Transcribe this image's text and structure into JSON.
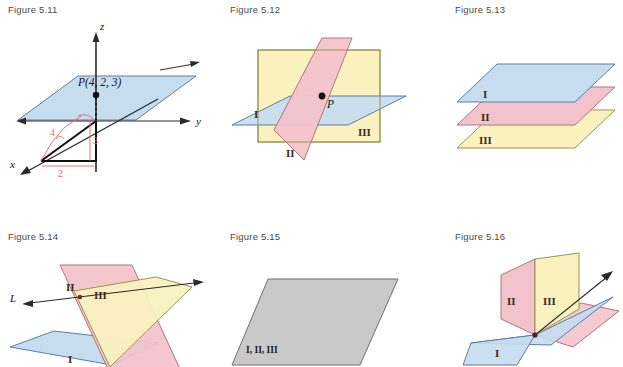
{
  "page": {
    "background": "#ffffff",
    "width": 623,
    "height": 342
  },
  "palette": {
    "blue_fill": "#c6dcef",
    "blue_stroke": "#5b7fa6",
    "pink_fill": "#f3c3cb",
    "pink_stroke": "#b4727f",
    "yellow_fill": "#f9f2bf",
    "yellow_stroke": "#9c9252",
    "grey_fill": "#c9c9c9",
    "grey_stroke": "#6e6e6e",
    "axis": "#2b2b2b",
    "red_annotation": "#e8676b",
    "label_text": "#4a4a4a"
  },
  "figures": [
    {
      "id": "fig-5-11",
      "label": "Figure 5.11",
      "type": "coordinate-axes-3d",
      "axes": [
        {
          "name": "z",
          "label": "z"
        },
        {
          "name": "y",
          "label": "y"
        },
        {
          "name": "x",
          "label": "x"
        }
      ],
      "point": {
        "label": "P(4, 2, 3)",
        "coords": [
          4,
          2,
          3
        ]
      },
      "measurements": [
        {
          "label": "4",
          "axis": "x-component"
        },
        {
          "label": "3",
          "axis": "z-component"
        },
        {
          "label": "2",
          "axis": "y-component"
        }
      ],
      "planes": [
        {
          "name": "horizontal-plane",
          "color": "blue"
        }
      ]
    },
    {
      "id": "fig-5-12",
      "label": "Figure 5.12",
      "type": "three-planes-single-point",
      "point": {
        "label": "P"
      },
      "planes": [
        {
          "name": "I",
          "label": "I",
          "color": "blue"
        },
        {
          "name": "II",
          "label": "II",
          "color": "pink"
        },
        {
          "name": "III",
          "label": "III",
          "color": "yellow"
        }
      ]
    },
    {
      "id": "fig-5-13",
      "label": "Figure 5.13",
      "type": "three-parallel-planes",
      "planes": [
        {
          "name": "I",
          "label": "I",
          "color": "blue"
        },
        {
          "name": "II",
          "label": "II",
          "color": "pink"
        },
        {
          "name": "III",
          "label": "III",
          "color": "yellow"
        }
      ]
    },
    {
      "id": "fig-5-14",
      "label": "Figure 5.14",
      "type": "three-planes-common-line",
      "line": {
        "label": "L"
      },
      "planes": [
        {
          "name": "I",
          "label": "I",
          "color": "blue"
        },
        {
          "name": "II",
          "label": "II",
          "color": "pink"
        },
        {
          "name": "III",
          "label": "III",
          "color": "yellow"
        }
      ]
    },
    {
      "id": "fig-5-15",
      "label": "Figure 5.15",
      "type": "coincident-planes",
      "planes": [
        {
          "name": "I-II-III",
          "label": "I, II, III",
          "color": "grey"
        }
      ]
    },
    {
      "id": "fig-5-16",
      "label": "Figure 5.16",
      "type": "three-planes-common-line",
      "planes": [
        {
          "name": "I",
          "label": "I",
          "color": "blue"
        },
        {
          "name": "II",
          "label": "II",
          "color": "pink"
        },
        {
          "name": "III",
          "label": "III",
          "color": "yellow"
        }
      ]
    }
  ]
}
